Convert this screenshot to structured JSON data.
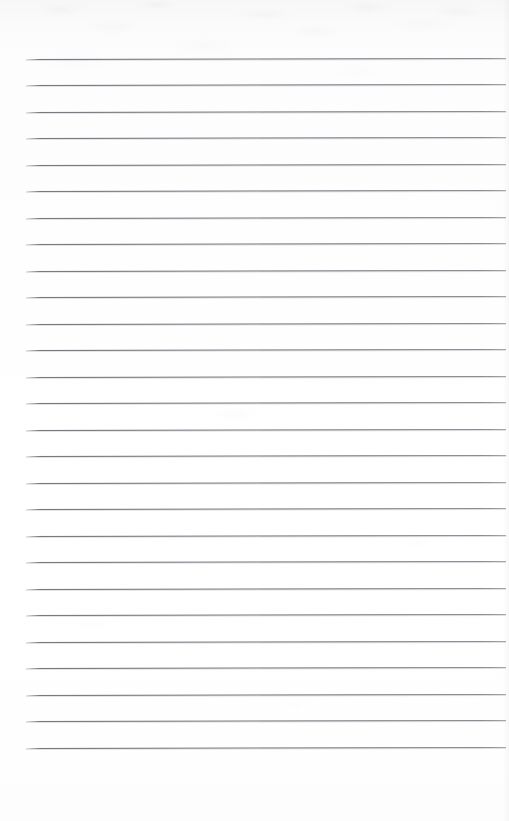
{
  "document": {
    "kind": "scanned-lined-paper",
    "title": "Blank lined notepad page",
    "page_width": 509,
    "page_height": 821,
    "content_text": "",
    "handwriting": "none",
    "background_color": "#fdfdfd",
    "rule_color": "#6c6f76",
    "rule_shadow_color": "#afb2b8"
  },
  "ruling": {
    "style": "wide-ruled horizontal lines",
    "line_count": 27,
    "first_line_y": 59,
    "last_line_y": 747,
    "line_spacing": 26.5,
    "line_thickness": 1,
    "line_left_x": 26,
    "line_right_x": 506,
    "skew_px": -1,
    "margins": {
      "top": 59,
      "left": 26,
      "right": 3,
      "bottom": 74
    },
    "has_vertical_margin_rule": false,
    "has_header_text": false,
    "has_page_number": false,
    "lines": [
      {
        "index": 1,
        "y": 59.0,
        "x1": 26,
        "x2": 506
      },
      {
        "index": 2,
        "y": 85.0,
        "x1": 26,
        "x2": 506
      },
      {
        "index": 3,
        "y": 111.5,
        "x1": 26,
        "x2": 506
      },
      {
        "index": 4,
        "y": 138.0,
        "x1": 26,
        "x2": 506
      },
      {
        "index": 5,
        "y": 164.5,
        "x1": 26,
        "x2": 506
      },
      {
        "index": 6,
        "y": 191.0,
        "x1": 26,
        "x2": 506
      },
      {
        "index": 7,
        "y": 217.5,
        "x1": 26,
        "x2": 506
      },
      {
        "index": 8,
        "y": 244.0,
        "x1": 26,
        "x2": 506
      },
      {
        "index": 9,
        "y": 270.5,
        "x1": 26,
        "x2": 506
      },
      {
        "index": 10,
        "y": 297.0,
        "x1": 26,
        "x2": 506
      },
      {
        "index": 11,
        "y": 323.5,
        "x1": 26,
        "x2": 506
      },
      {
        "index": 12,
        "y": 350.0,
        "x1": 26,
        "x2": 506
      },
      {
        "index": 13,
        "y": 376.5,
        "x1": 26,
        "x2": 506
      },
      {
        "index": 14,
        "y": 403.0,
        "x1": 26,
        "x2": 506
      },
      {
        "index": 15,
        "y": 429.5,
        "x1": 26,
        "x2": 506
      },
      {
        "index": 16,
        "y": 456.0,
        "x1": 26,
        "x2": 506
      },
      {
        "index": 17,
        "y": 482.5,
        "x1": 26,
        "x2": 506
      },
      {
        "index": 18,
        "y": 509.0,
        "x1": 26,
        "x2": 506
      },
      {
        "index": 19,
        "y": 535.5,
        "x1": 26,
        "x2": 506
      },
      {
        "index": 20,
        "y": 562.0,
        "x1": 26,
        "x2": 506
      },
      {
        "index": 21,
        "y": 588.5,
        "x1": 26,
        "x2": 506
      },
      {
        "index": 22,
        "y": 615.0,
        "x1": 26,
        "x2": 506
      },
      {
        "index": 23,
        "y": 641.5,
        "x1": 26,
        "x2": 506
      },
      {
        "index": 24,
        "y": 668.0,
        "x1": 26,
        "x2": 506
      },
      {
        "index": 25,
        "y": 694.5,
        "x1": 26,
        "x2": 506
      },
      {
        "index": 26,
        "y": 721.0,
        "x1": 26,
        "x2": 506
      },
      {
        "index": 27,
        "y": 747.5,
        "x1": 26,
        "x2": 506
      }
    ]
  }
}
